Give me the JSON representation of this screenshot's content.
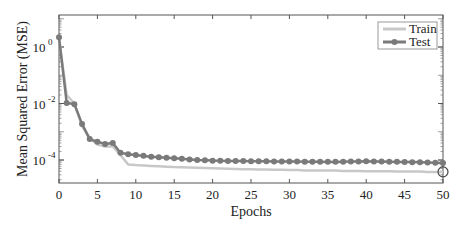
{
  "chart_data": {
    "type": "line",
    "title": "",
    "xlabel": "Epochs",
    "ylabel": "Mean Squared Error (MSE)",
    "xlim": [
      0,
      50
    ],
    "ylim": [
      1.3e-05,
      14
    ],
    "yscale": "log",
    "grid": false,
    "legend_position": "upper right",
    "x_ticks": [
      0,
      5,
      10,
      15,
      20,
      25,
      30,
      35,
      40,
      45,
      50
    ],
    "y_ticks": [
      {
        "value": 1,
        "label": "10",
        "exp": "0"
      },
      {
        "value": 0.01,
        "label": "10",
        "exp": "-2"
      },
      {
        "value": 0.0001,
        "label": "10",
        "exp": "-4"
      }
    ],
    "x": [
      0,
      1,
      2,
      3,
      4,
      5,
      6,
      7,
      8,
      9,
      10,
      11,
      12,
      13,
      14,
      15,
      16,
      17,
      18,
      19,
      20,
      21,
      22,
      23,
      24,
      25,
      26,
      27,
      28,
      29,
      30,
      31,
      32,
      33,
      34,
      35,
      36,
      37,
      38,
      39,
      40,
      41,
      42,
      43,
      44,
      45,
      46,
      47,
      48,
      49,
      50
    ],
    "series": [
      {
        "name": "Train",
        "color": "#c8c8c8",
        "marker": "none",
        "values": [
          2.0,
          0.02,
          0.01,
          0.0016,
          0.0006,
          0.00035,
          0.0003,
          0.0003,
          0.00015,
          7e-05,
          6.6e-05,
          6.4e-05,
          6.2e-05,
          6e-05,
          5.8e-05,
          5.6e-05,
          5.5e-05,
          5.4e-05,
          5.3e-05,
          5.2e-05,
          5.1e-05,
          5e-05,
          4.9e-05,
          4.8e-05,
          4.7e-05,
          4.7e-05,
          4.6e-05,
          4.6e-05,
          4.5e-05,
          4.5e-05,
          4.4e-05,
          4.4e-05,
          4.3e-05,
          4.3e-05,
          4.2e-05,
          4.2e-05,
          4.2e-05,
          4.1e-05,
          4.1e-05,
          4.1e-05,
          4e-05,
          4e-05,
          4e-05,
          4e-05,
          3.9e-05,
          3.9e-05,
          3.9e-05,
          3.9e-05,
          3.8e-05,
          3.8e-05,
          3.8e-05
        ]
      },
      {
        "name": "Test",
        "color": "#7a7a7a",
        "marker": "circle",
        "values": [
          2.2,
          0.0105,
          0.0095,
          0.0019,
          0.00055,
          0.00044,
          0.00037,
          0.0004,
          0.00018,
          0.00016,
          0.00015,
          0.00014,
          0.00013,
          0.000125,
          0.00012,
          0.000115,
          0.00011,
          0.000105,
          0.0001,
          9.8e-05,
          9.5e-05,
          9.4e-05,
          9.3e-05,
          9.2e-05,
          9.2e-05,
          9.1e-05,
          9e-05,
          9e-05,
          8.9e-05,
          8.9e-05,
          8.8e-05,
          8.8e-05,
          8.7e-05,
          8.7e-05,
          8.7e-05,
          8.6e-05,
          8.6e-05,
          8.7e-05,
          8.8e-05,
          8.9e-05,
          9e-05,
          8.9e-05,
          8.8e-05,
          8.7e-05,
          8.6e-05,
          8.5e-05,
          8.4e-05,
          8.3e-05,
          8.2e-05,
          8e-05,
          7.9e-05
        ]
      }
    ],
    "annotations": [
      {
        "type": "hollow-circle",
        "x": 50,
        "y": 3.8e-05,
        "series": "Train",
        "note": "best epoch marker"
      }
    ]
  },
  "legend": {
    "items": [
      {
        "label": "Train"
      },
      {
        "label": "Test"
      }
    ]
  },
  "axes": {
    "xlabel": "Epochs",
    "ylabel": "Mean Squared Error (MSE)"
  }
}
